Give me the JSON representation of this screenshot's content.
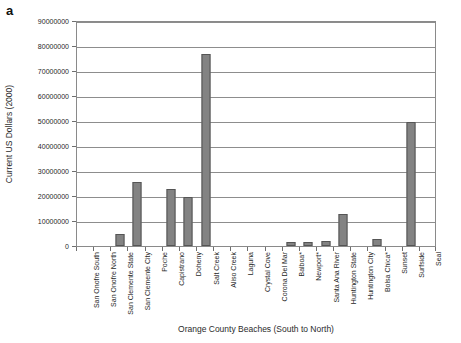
{
  "panel": {
    "label": "a"
  },
  "chart_data": {
    "type": "bar",
    "title": "",
    "xlabel": "Orange County Beaches (South to North)",
    "ylabel": "Current US Dollars (2000)",
    "ylim": [
      0,
      90000000
    ],
    "ytick_step": 10000000,
    "ytick_labels": [
      "90000000",
      "80000000",
      "70000000",
      "60000000",
      "50000000",
      "40000000",
      "30000000",
      "20000000",
      "10000000",
      "0"
    ],
    "grid": true,
    "legend": null,
    "bar_color": "#838383",
    "bar_edge_color": "#555555",
    "categories": [
      "San Onofre South",
      "San Onofre North",
      "San Clemente State",
      "San Clemente City",
      "Poche",
      "Capistrano",
      "Doheny",
      "Salt Creek",
      "Aliso Creek",
      "Laguna",
      "Crystal Cove",
      "Corona Del Mar",
      "Balboa*",
      "Newport*",
      "Santa Ana River",
      "Huntington State",
      "Huntington City",
      "Bolsa Chica*",
      "Sunset",
      "Surfside",
      "Seal"
    ],
    "values": [
      0,
      0,
      5000000,
      25500000,
      0,
      23000000,
      19500000,
      77000000,
      0,
      0,
      0,
      0,
      1800000,
      1700000,
      2100000,
      13000000,
      0,
      3000000,
      0,
      49500000,
      0
    ]
  }
}
